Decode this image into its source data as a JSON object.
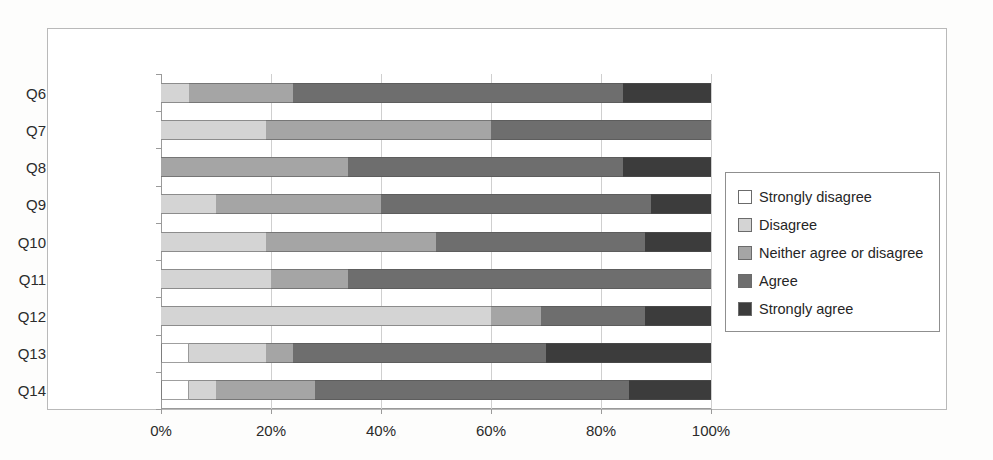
{
  "chart_data": {
    "type": "bar",
    "orientation": "horizontal",
    "stacked": true,
    "normalized_percent": true,
    "title": "",
    "xlabel": "",
    "ylabel": "",
    "xlim": [
      0,
      100
    ],
    "xticks": [
      "0%",
      "20%",
      "40%",
      "60%",
      "80%",
      "100%"
    ],
    "xtick_values": [
      0,
      20,
      40,
      60,
      80,
      100
    ],
    "grid": "vertical",
    "legend_position": "right",
    "categories": [
      "Q6",
      "Q7",
      "Q8",
      "Q9",
      "Q10",
      "Q11",
      "Q12",
      "Q13",
      "Q14"
    ],
    "series": [
      {
        "name": "Strongly disagree",
        "color": "#ffffff",
        "values": [
          0,
          0,
          0,
          0,
          0,
          0,
          0,
          5,
          5
        ]
      },
      {
        "name": "Disagree",
        "color": "#d4d4d4",
        "values": [
          5,
          19,
          0,
          10,
          19,
          20,
          60,
          14,
          5
        ]
      },
      {
        "name": "Neither agree or disagree",
        "color": "#a5a5a5",
        "values": [
          19,
          41,
          34,
          30,
          31,
          14,
          9,
          5,
          18
        ]
      },
      {
        "name": "Agree",
        "color": "#6e6e6e",
        "values": [
          60,
          40,
          50,
          49,
          38,
          66,
          19,
          46,
          57
        ]
      },
      {
        "name": "Strongly agree",
        "color": "#3c3c3c",
        "values": [
          16,
          0,
          16,
          11,
          12,
          0,
          12,
          30,
          15
        ]
      }
    ]
  },
  "legend": {
    "items": [
      {
        "label": "Strongly disagree"
      },
      {
        "label": "Disagree"
      },
      {
        "label": "Neither agree or disagree"
      },
      {
        "label": "Agree"
      },
      {
        "label": "Strongly agree"
      }
    ]
  }
}
